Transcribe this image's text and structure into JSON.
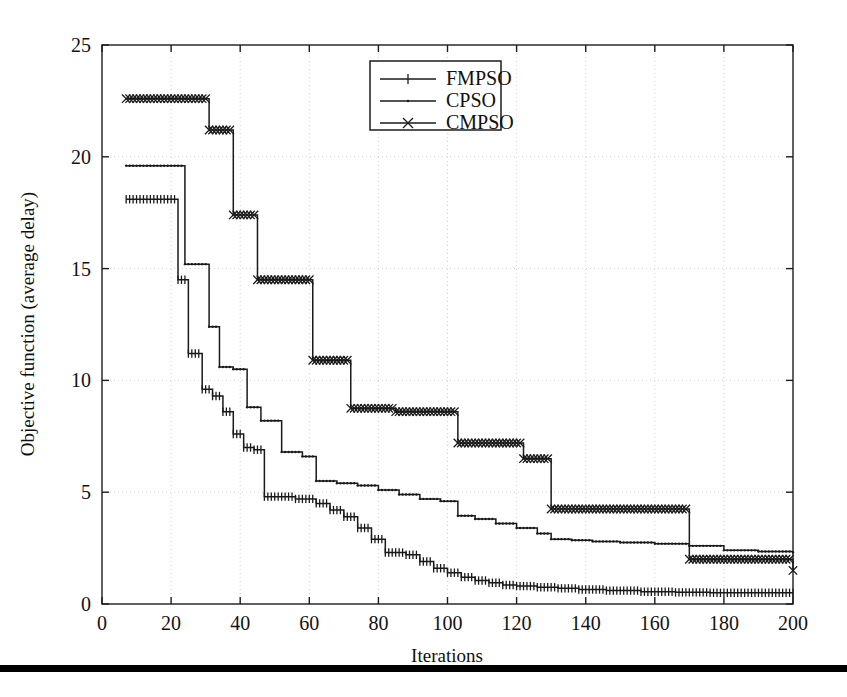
{
  "figure": {
    "background_color": "#ffffff",
    "ink_color": "#1a1a1a",
    "grid_color": "#c9c9c9",
    "bottom_rule_color": "#000000"
  },
  "chart_data": {
    "type": "line",
    "title": "",
    "subtitle": "",
    "xlabel": "Iterations",
    "ylabel": "Objective function (average delay)",
    "xlim": [
      0,
      200
    ],
    "ylim": [
      0,
      25
    ],
    "xticks": [
      0,
      20,
      40,
      60,
      80,
      100,
      120,
      140,
      160,
      180,
      200
    ],
    "yticks": [
      0,
      5,
      10,
      15,
      20,
      25
    ],
    "grid": true,
    "grid_style": "dotted",
    "legend_position": "top-center",
    "legend_entries": [
      "FMPSO",
      "CPSO",
      "CMPSO"
    ],
    "step_style": "post",
    "series": [
      {
        "name": "FMPSO",
        "marker": "plus",
        "x": [
          7,
          22,
          25,
          29,
          32,
          35,
          38,
          41,
          44,
          47,
          56,
          62,
          66,
          70,
          74,
          78,
          82,
          88,
          92,
          96,
          100,
          104,
          108,
          112,
          116,
          120,
          126,
          132,
          138,
          146,
          156,
          166,
          176,
          186,
          200
        ],
        "values": [
          18.1,
          14.5,
          11.2,
          9.6,
          9.3,
          8.6,
          7.6,
          7.0,
          6.9,
          4.8,
          4.7,
          4.5,
          4.2,
          3.9,
          3.4,
          2.9,
          2.3,
          2.2,
          1.9,
          1.6,
          1.4,
          1.2,
          1.05,
          0.95,
          0.85,
          0.8,
          0.75,
          0.7,
          0.65,
          0.6,
          0.55,
          0.52,
          0.5,
          0.5,
          0.5
        ]
      },
      {
        "name": "CPSO",
        "marker": "dot",
        "x": [
          7,
          21,
          24,
          31,
          34,
          38,
          42,
          46,
          52,
          58,
          62,
          68,
          74,
          80,
          86,
          92,
          98,
          103,
          108,
          114,
          120,
          126,
          130,
          136,
          142,
          150,
          160,
          170,
          180,
          190,
          200
        ],
        "values": [
          19.6,
          19.6,
          15.2,
          12.4,
          10.6,
          10.5,
          8.8,
          8.2,
          6.8,
          6.6,
          5.5,
          5.4,
          5.3,
          5.1,
          4.9,
          4.7,
          4.6,
          3.95,
          3.8,
          3.6,
          3.4,
          3.15,
          2.9,
          2.85,
          2.8,
          2.75,
          2.7,
          2.6,
          2.4,
          2.35,
          2.3
        ]
      },
      {
        "name": "CMPSO",
        "marker": "cross",
        "x": [
          7,
          26,
          31,
          34,
          38,
          45,
          52,
          61,
          72,
          85,
          103,
          122,
          130,
          142,
          170,
          200
        ],
        "values": [
          22.6,
          22.6,
          21.2,
          21.2,
          17.4,
          14.5,
          14.5,
          10.9,
          8.75,
          8.6,
          7.2,
          6.5,
          4.25,
          4.25,
          2.0,
          1.5
        ]
      }
    ]
  },
  "axes": {
    "x_tick_labels": [
      "0",
      "20",
      "40",
      "60",
      "80",
      "100",
      "120",
      "140",
      "160",
      "180",
      "200"
    ],
    "y_tick_labels": [
      "0",
      "5",
      "10",
      "15",
      "20",
      "25"
    ],
    "x_axis_title": "Iterations",
    "y_axis_title": "Objective function (average delay)"
  },
  "legend": {
    "items": [
      {
        "label": "FMPSO",
        "marker": "plus-marker"
      },
      {
        "label": "CPSO",
        "marker": "dot-marker"
      },
      {
        "label": "CMPSO",
        "marker": "cross-marker"
      }
    ]
  }
}
